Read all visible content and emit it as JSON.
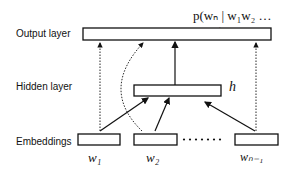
{
  "layers": {
    "output": "Output layer",
    "hidden": "Hidden layer",
    "embeddings": "Embeddings"
  },
  "formula": "p(wₙ | w₁w₂ … wₙ₋₁)",
  "hidden_symbol": "h",
  "words": [
    "w₁",
    "w₂",
    "wₙ₋₁"
  ],
  "ellipsis": "• • • • • •"
}
